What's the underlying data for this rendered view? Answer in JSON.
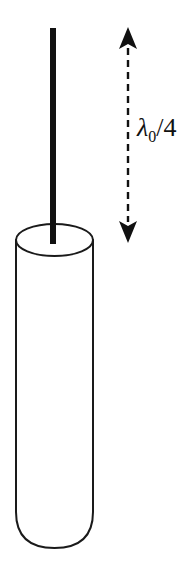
{
  "figure": {
    "name": "quarter-wave-monopole-antenna-diagram",
    "background_color": "#ffffff",
    "stroke_color": "#1a1a1a",
    "fill_color": "#111111",
    "width": 187,
    "height": 572,
    "elements": {
      "rod": {
        "label": "antenna-rod",
        "description": "vertical solid black rod",
        "x": 50,
        "top_y": 28,
        "bottom_y": 244,
        "thickness": 6
      },
      "cylinder": {
        "label": "cylindrical-body",
        "description": "open-top cylinder with rounded bottom",
        "left_x": 16,
        "right_x": 93,
        "top_ellipse_center_y": 240,
        "top_ellipse_ry": 16,
        "bottom_y": 548
      },
      "dimension_arrow": {
        "label": "double-headed-dashed-arrow",
        "x": 128,
        "top_y": 27,
        "bottom_y": 243,
        "style": "dashed",
        "dash_length": 7,
        "dash_gap": 5,
        "arrowhead_width": 18,
        "arrowhead_height": 20
      }
    },
    "annotations": {
      "dimension_label": {
        "text": "λ0/4",
        "symbol": "λ",
        "subscript": "0",
        "divider": "/",
        "denominator": "4",
        "x": 137,
        "y": 136
      }
    }
  }
}
